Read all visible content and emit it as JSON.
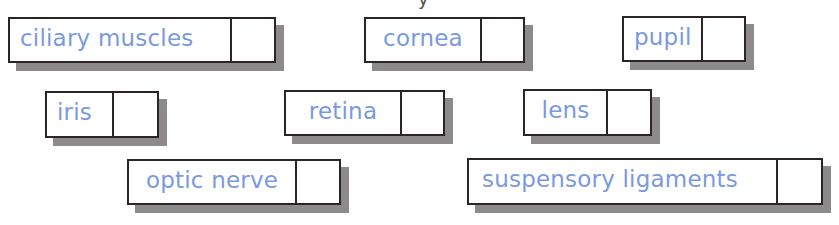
{
  "cropped_text_fragment": "y",
  "colors": {
    "label_text": "#7a99df",
    "border": "#2b2526",
    "shadow": "#8c8a8b",
    "background": "#ffffff"
  },
  "labels": [
    {
      "id": "ciliary-muscles",
      "text": "ciliary muscles",
      "answer": ""
    },
    {
      "id": "cornea",
      "text": "cornea",
      "answer": ""
    },
    {
      "id": "pupil",
      "text": "pupil",
      "answer": ""
    },
    {
      "id": "iris",
      "text": "iris",
      "answer": ""
    },
    {
      "id": "retina",
      "text": "retina",
      "answer": ""
    },
    {
      "id": "lens",
      "text": "lens",
      "answer": ""
    },
    {
      "id": "optic-nerve",
      "text": "optic nerve",
      "answer": ""
    },
    {
      "id": "suspensory-ligaments",
      "text": "suspensory ligaments",
      "answer": ""
    }
  ]
}
